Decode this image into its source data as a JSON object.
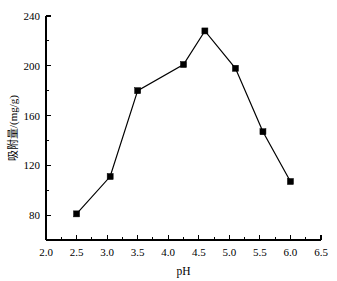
{
  "chart_data": {
    "type": "line",
    "title": "",
    "xlabel": "pH",
    "ylabel": "吸附量/(mg/g)",
    "xlim": [
      2.0,
      6.5
    ],
    "ylim": [
      60,
      240
    ],
    "grid": false,
    "legend": null,
    "marker": "filled-square",
    "line_color": "#000000",
    "marker_color": "#000000",
    "x": [
      2.5,
      3.05,
      3.5,
      4.25,
      4.6,
      5.1,
      5.55,
      6.0
    ],
    "values": [
      81,
      111,
      180,
      201,
      228,
      198,
      147,
      107
    ],
    "points": [
      {
        "x": 2.5,
        "y": 81
      },
      {
        "x": 3.05,
        "y": 111
      },
      {
        "x": 3.5,
        "y": 180
      },
      {
        "x": 4.25,
        "y": 201
      },
      {
        "x": 4.6,
        "y": 228
      },
      {
        "x": 5.1,
        "y": 198
      },
      {
        "x": 5.55,
        "y": 147
      },
      {
        "x": 6.0,
        "y": 107
      }
    ],
    "x_ticks": [
      2.0,
      2.5,
      3.0,
      3.5,
      4.0,
      4.5,
      5.0,
      5.5,
      6.0,
      6.5
    ],
    "x_tick_labels": [
      "2.0",
      "2.5",
      "3.0",
      "3.5",
      "4.0",
      "4.5",
      "5.0",
      "5.5",
      "6.0",
      "6.5"
    ],
    "x_minor_ticks": [
      2.25,
      2.75,
      3.25,
      3.75,
      4.25,
      4.75,
      5.25,
      5.75,
      6.25
    ],
    "y_ticks": [
      80,
      120,
      160,
      200,
      240
    ],
    "y_tick_labels": [
      "80",
      "120",
      "160",
      "200",
      "240"
    ],
    "y_minor_ticks": [
      60,
      100,
      140,
      180,
      220
    ],
    "axis_style": "left-and-bottom-spines"
  },
  "axes": {
    "x_title": "pH",
    "y_title_cn": "吸附量",
    "y_title_unit": "/(mg/g)",
    "y_title_full": "吸附量/(mg/g)"
  }
}
